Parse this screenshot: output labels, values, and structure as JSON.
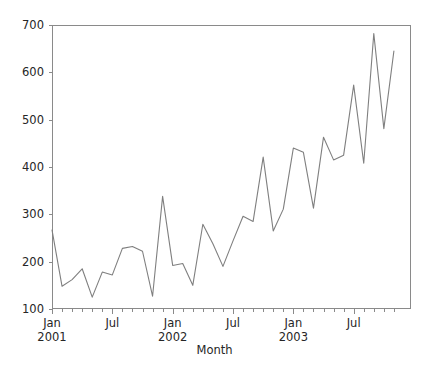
{
  "chart_data": {
    "type": "line",
    "title": "",
    "xlabel": "Month",
    "ylabel": "",
    "ylim": [
      100,
      700
    ],
    "yticks": [
      100,
      200,
      300,
      400,
      500,
      600,
      700
    ],
    "grid": false,
    "legend": null,
    "line_color": "#7f7f7f",
    "line_width": 1.1,
    "x_major_ticks": [
      {
        "x": "2001-01",
        "label": "Jan",
        "sublabel": "2001"
      },
      {
        "x": "2001-07",
        "label": "Jul",
        "sublabel": ""
      },
      {
        "x": "2002-01",
        "label": "Jan",
        "sublabel": "2002"
      },
      {
        "x": "2002-07",
        "label": "Jul",
        "sublabel": ""
      },
      {
        "x": "2003-01",
        "label": "Jan",
        "sublabel": "2003"
      },
      {
        "x": "2003-07",
        "label": "Jul",
        "sublabel": ""
      }
    ],
    "x": [
      "2001-01",
      "2001-02",
      "2001-03",
      "2001-04",
      "2001-05",
      "2001-06",
      "2001-07",
      "2001-08",
      "2001-09",
      "2001-10",
      "2001-11",
      "2001-12",
      "2002-01",
      "2002-02",
      "2002-03",
      "2002-04",
      "2002-05",
      "2002-06",
      "2002-07",
      "2002-08",
      "2002-09",
      "2002-10",
      "2002-11",
      "2002-12",
      "2003-01",
      "2003-02",
      "2003-03",
      "2003-04",
      "2003-05",
      "2003-06",
      "2003-07",
      "2003-08",
      "2003-09",
      "2003-10",
      "2003-11"
    ],
    "values": [
      267,
      148,
      162,
      185,
      125,
      178,
      172,
      228,
      232,
      222,
      127,
      338,
      192,
      196,
      150,
      279,
      238,
      190,
      244,
      296,
      285,
      421,
      265,
      311,
      440,
      431,
      313,
      463,
      415,
      425,
      573,
      408,
      682,
      481,
      645
    ],
    "series_name": "monthly value",
    "x_count": 35
  }
}
